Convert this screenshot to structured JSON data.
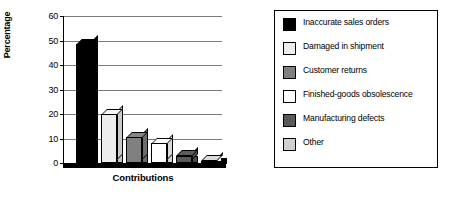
{
  "chart_data": {
    "type": "bar",
    "title": "",
    "xlabel": "Contributions",
    "ylabel": "Percentage",
    "ylim": [
      0,
      60
    ],
    "ytick_step": 10,
    "yticks": [
      "60",
      "50",
      "40",
      "30",
      "20",
      "10",
      "0"
    ],
    "grid": true,
    "legend_position": "right",
    "categories": [
      "Inaccurate sales orders",
      "Damaged in shipment",
      "Customer returns",
      "Finished-goods obsolescence",
      "Manufacturing defects",
      "Other"
    ],
    "values": [
      48.5,
      20,
      10.5,
      8,
      3,
      1
    ],
    "colors": [
      "#000000",
      "#ededed",
      "#808080",
      "#ffffff",
      "#595959",
      "#d0d0d0"
    ]
  },
  "chart": {
    "y_axis_title": "Percentage",
    "x_axis_title": "Contributions"
  },
  "legend": {
    "items": [
      {
        "label": "Inaccurate sales orders",
        "color": "#000000"
      },
      {
        "label": "Damaged in shipment",
        "color": "#ededed"
      },
      {
        "label": "Customer returns",
        "color": "#808080"
      },
      {
        "label": "Finished-goods obsolescence",
        "color": "#ffffff"
      },
      {
        "label": "Manufacturing defects",
        "color": "#595959"
      },
      {
        "label": "Other",
        "color": "#d0d0d0"
      }
    ]
  }
}
